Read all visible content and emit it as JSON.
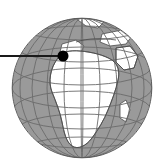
{
  "figure": {
    "type": "globe-locator-map",
    "title": "World globe locator",
    "width": 165,
    "height": 168,
    "background_color": "#ffffff"
  },
  "globe": {
    "projection": "orthographic",
    "center_x": 82,
    "center_y": 88,
    "radius": 70,
    "ocean_color": "#9a9a9a",
    "land_color": "#ffffff",
    "coastline_color": "#4a4a4a",
    "outline_color": "#5a5a5a",
    "graticule_color": "#6b6b6b",
    "graticule_spacing_degrees": 15,
    "view_center_longitude": 15,
    "view_center_latitude": 20,
    "label": "Earth globe showing Africa, Europe and the Middle East",
    "cropped_edge": "top"
  },
  "marker": {
    "name": "location-marker",
    "color": "#000000",
    "x": 63,
    "y": 56,
    "radius": 5.5,
    "label": "Marked location"
  },
  "leader_line": {
    "name": "leader-line",
    "color": "#1a1a1a",
    "x1": 0,
    "y1": 56,
    "x2": 63,
    "y2": 56,
    "width": 1.8,
    "label": "Leader line to marked location"
  },
  "landmasses": [
    {
      "name": "africa"
    },
    {
      "name": "europe"
    },
    {
      "name": "middle-east"
    },
    {
      "name": "greenland"
    },
    {
      "name": "mediterranean-sea"
    },
    {
      "name": "north-atlantic-ocean"
    }
  ]
}
